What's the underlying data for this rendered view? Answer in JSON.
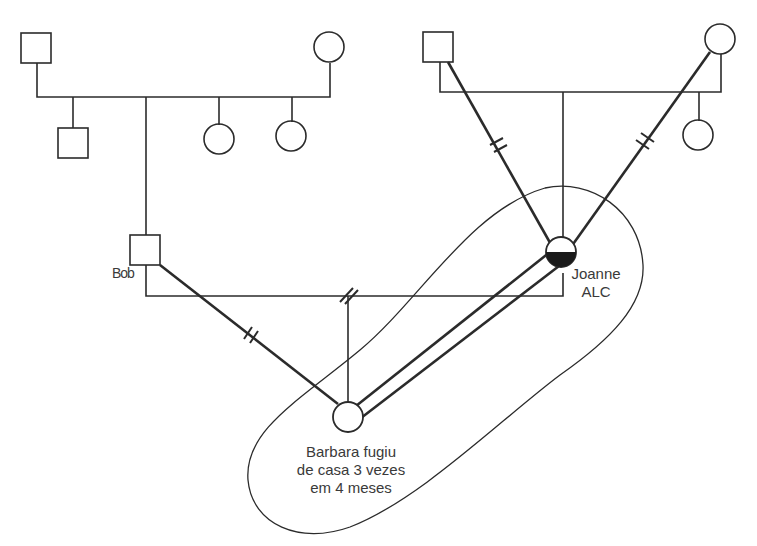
{
  "diagram": {
    "type": "genogram",
    "people": [
      {
        "id": "pgf",
        "sex": "male",
        "role": "Bob's father"
      },
      {
        "id": "pgm",
        "sex": "female",
        "role": "Bob's mother"
      },
      {
        "id": "bob_brother",
        "sex": "male",
        "role": "Bob's sibling"
      },
      {
        "id": "bob_sister1",
        "sex": "female",
        "role": "Bob's sibling"
      },
      {
        "id": "bob_sister2",
        "sex": "female",
        "role": "Bob's sibling"
      },
      {
        "id": "bob",
        "sex": "male",
        "label": "Bob"
      },
      {
        "id": "mgf",
        "sex": "male",
        "role": "Joanne's father"
      },
      {
        "id": "mgm",
        "sex": "female",
        "role": "Joanne's mother"
      },
      {
        "id": "joanne_sister",
        "sex": "female",
        "role": "Joanne's sibling"
      },
      {
        "id": "joanne",
        "sex": "female",
        "label": "Joanne",
        "note": "ALC",
        "fill": "bottom-half"
      },
      {
        "id": "barbara",
        "sex": "female",
        "label": "Barbara",
        "note": "fugiu de casa 3 vezes em 4 meses"
      }
    ],
    "relationships": [
      {
        "from": "bob",
        "to": "joanne",
        "type": "divorced"
      },
      {
        "from": "bob",
        "to": "barbara",
        "type": "cutoff"
      },
      {
        "from": "joanne",
        "to": "barbara",
        "type": "close"
      },
      {
        "from": "mgf",
        "to": "joanne",
        "type": "cutoff"
      },
      {
        "from": "mgm",
        "to": "joanne",
        "type": "cutoff"
      }
    ],
    "boundary": "triangle enclosing Joanne and Barbara"
  },
  "labels": {
    "bob": "Bob",
    "joanne_name": "Joanne",
    "joanne_note": "ALC",
    "barbara_line1": "Barbara fugiu",
    "barbara_line2": "de casa 3 vezes",
    "barbara_line3": "em 4 meses"
  },
  "colors": {
    "line": "#2b2b2b",
    "text": "#3a3a3a",
    "background": "#ffffff"
  }
}
